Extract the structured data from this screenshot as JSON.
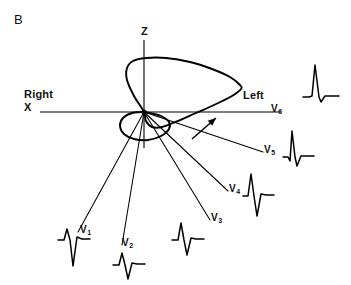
{
  "figure": {
    "panel_label": "B",
    "type": "vectorcardiogram-qrs-loop",
    "stroke_color": "#000000",
    "background_color": "#ffffff"
  },
  "axes": {
    "horizontal": {
      "name": "X",
      "label": "X",
      "left_annotation": "Right",
      "right_annotation": "Left",
      "right_end_label": "V6"
    },
    "vertical": {
      "name": "Z",
      "label": "Z"
    },
    "origin_label": ""
  },
  "chart_data": {
    "type": "line",
    "title": "",
    "subtitle": "",
    "xlabel": "X",
    "ylabel": "Z",
    "grid": false,
    "legend": "none",
    "origin": {
      "x": 144,
      "y": 112
    },
    "rotation_arrow": {
      "label": "",
      "from": {
        "x": 192,
        "y": 139
      },
      "to": {
        "x": 216,
        "y": 118
      }
    },
    "loops": [
      {
        "name": "main-qrs-loop",
        "closed": true,
        "points": [
          [
            144,
            112
          ],
          [
            134,
            96
          ],
          [
            127,
            80
          ],
          [
            127,
            68
          ],
          [
            133,
            61
          ],
          [
            146,
            58
          ],
          [
            166,
            58
          ],
          [
            190,
            62
          ],
          [
            212,
            69
          ],
          [
            230,
            77
          ],
          [
            240,
            85
          ],
          [
            241,
            89
          ],
          [
            232,
            96
          ],
          [
            214,
            105
          ],
          [
            196,
            113
          ],
          [
            178,
            121
          ],
          [
            162,
            127
          ],
          [
            152,
            127
          ],
          [
            146,
            121
          ],
          [
            144,
            112
          ]
        ]
      },
      {
        "name": "terminal-lower-loop",
        "closed": true,
        "points": [
          [
            144,
            112
          ],
          [
            132,
            113
          ],
          [
            123,
            118
          ],
          [
            120,
            126
          ],
          [
            124,
            134
          ],
          [
            134,
            139
          ],
          [
            148,
            140
          ],
          [
            161,
            136
          ],
          [
            169,
            129
          ],
          [
            169,
            122
          ],
          [
            161,
            116
          ],
          [
            150,
            113
          ],
          [
            144,
            112
          ]
        ]
      }
    ],
    "lead_vectors": [
      {
        "label": "V1",
        "from": {
          "x": 144,
          "y": 112
        },
        "to": {
          "x": 78,
          "y": 232
        },
        "label_pos": {
          "x": 80,
          "y": 231
        }
      },
      {
        "label": "V2",
        "from": {
          "x": 144,
          "y": 112
        },
        "to": {
          "x": 122,
          "y": 245
        },
        "label_pos": {
          "x": 122,
          "y": 244
        }
      },
      {
        "label": "V3",
        "from": {
          "x": 144,
          "y": 112
        },
        "to": {
          "x": 210,
          "y": 220
        },
        "label_pos": {
          "x": 211,
          "y": 219
        }
      },
      {
        "label": "V4",
        "from": {
          "x": 144,
          "y": 112
        },
        "to": {
          "x": 228,
          "y": 191
        },
        "label_pos": {
          "x": 229,
          "y": 190
        }
      },
      {
        "label": "V5",
        "from": {
          "x": 144,
          "y": 112
        },
        "to": {
          "x": 263,
          "y": 152
        },
        "label_pos": {
          "x": 264,
          "y": 151
        }
      },
      {
        "label": "V6",
        "from": {
          "x": 144,
          "y": 112
        },
        "to": {
          "x": 281,
          "y": 112
        },
        "label_pos": {
          "x": 271,
          "y": 110
        }
      }
    ],
    "waveforms": [
      {
        "lead": "V1",
        "description": "small r, deep S",
        "origin": {
          "x": 58,
          "y": 240
        },
        "points": [
          [
            0,
            0
          ],
          [
            6,
            0
          ],
          [
            9,
            -11
          ],
          [
            12,
            0
          ],
          [
            15,
            26
          ],
          [
            19,
            -3
          ],
          [
            24,
            -1
          ],
          [
            32,
            -1
          ]
        ]
      },
      {
        "lead": "V2",
        "description": "small r, deep S",
        "origin": {
          "x": 113,
          "y": 265
        },
        "points": [
          [
            0,
            0
          ],
          [
            6,
            0
          ],
          [
            9,
            -12
          ],
          [
            12,
            0
          ],
          [
            15,
            14
          ],
          [
            19,
            -2
          ],
          [
            24,
            -1
          ],
          [
            32,
            -1
          ]
        ]
      },
      {
        "lead": "V3",
        "description": "equiphasic R and S",
        "origin": {
          "x": 172,
          "y": 240
        },
        "points": [
          [
            0,
            0
          ],
          [
            6,
            0
          ],
          [
            9,
            -17
          ],
          [
            12,
            0
          ],
          [
            15,
            15
          ],
          [
            19,
            -2
          ],
          [
            24,
            -1
          ],
          [
            32,
            -1
          ]
        ]
      },
      {
        "lead": "V4",
        "description": "tall R, deep S",
        "origin": {
          "x": 243,
          "y": 196
        },
        "points": [
          [
            0,
            0
          ],
          [
            5,
            0
          ],
          [
            8,
            -22
          ],
          [
            11,
            0
          ],
          [
            14,
            20
          ],
          [
            18,
            -2
          ],
          [
            23,
            -1
          ],
          [
            31,
            -1
          ]
        ]
      },
      {
        "lead": "V5",
        "description": "small q, tall R, small s",
        "origin": {
          "x": 283,
          "y": 157
        },
        "points": [
          [
            0,
            0
          ],
          [
            5,
            0
          ],
          [
            7,
            4
          ],
          [
            9,
            -26
          ],
          [
            12,
            0
          ],
          [
            14,
            9
          ],
          [
            18,
            -1
          ],
          [
            24,
            -1
          ],
          [
            31,
            -1
          ]
        ]
      },
      {
        "lead": "V6",
        "description": "tall narrow R, small s",
        "origin": {
          "x": 303,
          "y": 97
        },
        "points": [
          [
            0,
            0
          ],
          [
            6,
            0
          ],
          [
            9,
            -1
          ],
          [
            12,
            -32
          ],
          [
            16,
            0
          ],
          [
            18,
            5
          ],
          [
            22,
            -1
          ],
          [
            28,
            -1
          ],
          [
            36,
            -1
          ]
        ]
      }
    ],
    "annotations": [
      {
        "text": "B",
        "x": 18,
        "y": 22,
        "role": "panel-label"
      },
      {
        "text": "Z",
        "x": 141,
        "y": 33,
        "role": "axis-label"
      },
      {
        "text": "X",
        "x": 26,
        "y": 110,
        "role": "axis-label"
      },
      {
        "text": "Right",
        "x": 26,
        "y": 97,
        "role": "orientation-label"
      },
      {
        "text": "Left",
        "x": 244,
        "y": 98,
        "role": "orientation-label"
      }
    ]
  }
}
